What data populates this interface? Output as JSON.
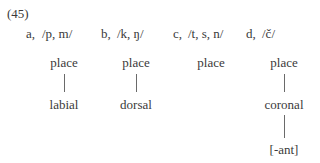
{
  "example_number": "(45)",
  "columns": [
    {
      "label": "a,",
      "segments": "/p, m/",
      "nodes": [
        "place",
        "labial"
      ]
    },
    {
      "label": "b,",
      "segments": "/k, ŋ/",
      "nodes": [
        "place",
        "dorsal"
      ]
    },
    {
      "label": "c,",
      "segments": "/t, s, n/",
      "nodes": [
        "place"
      ]
    },
    {
      "label": "d,",
      "segments": "/č/",
      "nodes": [
        "place",
        "coronal",
        "[-ant]"
      ]
    }
  ]
}
